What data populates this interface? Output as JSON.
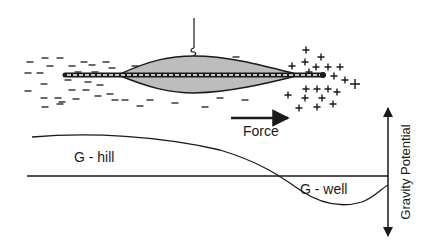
{
  "colors": {
    "ink": "#1a1a1a",
    "fill": "#bdbdbd",
    "background": "#ffffff"
  },
  "labels": {
    "force": "Force",
    "g_hill": "G - hill",
    "g_well": "G - well",
    "axis": "Gravity Potential"
  },
  "hanger": {
    "x": 194,
    "y_top": 18,
    "y_bottom": 55
  },
  "body": {
    "path": "M118,75 C150,60 170,56 194,56 C230,56 265,66 300,75 C265,84 230,92 194,93 C170,93 150,88 118,75 Z"
  },
  "rod": {
    "x1": 65,
    "x2": 323,
    "y": 75
  },
  "negatives": [
    [
      45,
      58
    ],
    [
      60,
      58
    ],
    [
      28,
      73
    ],
    [
      40,
      73
    ],
    [
      44,
      84
    ],
    [
      28,
      91
    ],
    [
      44,
      98
    ],
    [
      58,
      98
    ],
    [
      45,
      107
    ],
    [
      60,
      104
    ],
    [
      72,
      66
    ],
    [
      84,
      62
    ],
    [
      92,
      65
    ],
    [
      78,
      72
    ],
    [
      95,
      72
    ],
    [
      68,
      80
    ],
    [
      88,
      82
    ],
    [
      72,
      90
    ],
    [
      86,
      90
    ],
    [
      100,
      85
    ],
    [
      62,
      102
    ],
    [
      76,
      99
    ],
    [
      98,
      96
    ],
    [
      110,
      94
    ],
    [
      115,
      100
    ],
    [
      106,
      62
    ],
    [
      112,
      68
    ],
    [
      135,
      66
    ],
    [
      158,
      63
    ],
    [
      178,
      58
    ],
    [
      210,
      60
    ],
    [
      236,
      57
    ],
    [
      256,
      65
    ],
    [
      150,
      100
    ],
    [
      175,
      103
    ],
    [
      205,
      107
    ],
    [
      220,
      98
    ],
    [
      245,
      100
    ],
    [
      125,
      100
    ],
    [
      140,
      106
    ],
    [
      30,
      62
    ],
    [
      50,
      66
    ]
  ],
  "positives": [
    [
      306,
      50
    ],
    [
      321,
      57
    ],
    [
      292,
      66
    ],
    [
      305,
      62
    ],
    [
      316,
      67
    ],
    [
      328,
      67
    ],
    [
      340,
      67
    ],
    [
      309,
      72
    ],
    [
      334,
      76
    ],
    [
      345,
      80
    ],
    [
      306,
      89
    ],
    [
      317,
      89
    ],
    [
      328,
      89
    ],
    [
      337,
      92
    ],
    [
      288,
      95
    ],
    [
      305,
      98
    ],
    [
      322,
      98
    ],
    [
      333,
      104
    ],
    [
      299,
      108
    ],
    [
      317,
      107
    ],
    [
      355,
      84
    ]
  ],
  "force_arrow": {
    "x1": 231,
    "y1": 118,
    "x2": 288,
    "y2": 118
  },
  "potential": {
    "baseline": {
      "x1": 27,
      "x2": 388,
      "y": 176
    },
    "curve": "M32,137 C90,132 160,136 220,150 C260,162 280,176 300,190 C325,207 345,207 362,202 C375,197 382,188 388,185"
  },
  "axis": {
    "x": 388,
    "y_top": 108,
    "y_bottom": 236
  },
  "label_pos": {
    "force": [
      243,
      136
    ],
    "g_hill": [
      74,
      162
    ],
    "g_well": [
      300,
      194
    ],
    "axis": [
      410,
      172
    ]
  }
}
